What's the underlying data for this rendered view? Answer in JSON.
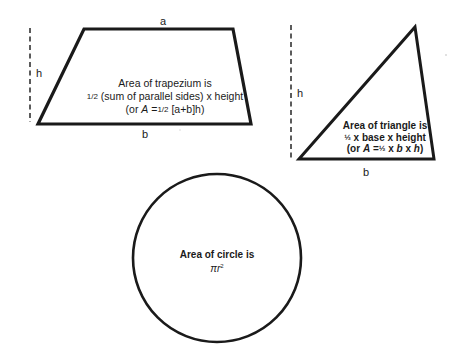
{
  "trapezium": {
    "top_label": "a",
    "bottom_label": "b",
    "height_label": "h",
    "caption": {
      "line1": "Area of trapezium is",
      "line2_frac": "1/2",
      "line2_rest": " (sum of parallel sides) x height",
      "line3_pre": "(or ",
      "line3_var": "A",
      "line3_eq": " =",
      "line3_frac": "1/2",
      "line3_rest": " [a+b]h)"
    },
    "vertices": [
      [
        84,
        29
      ],
      [
        233,
        29
      ],
      [
        251,
        124
      ],
      [
        38,
        124
      ]
    ],
    "stroke_color": "#1a1a1a"
  },
  "triangle": {
    "bottom_label": "b",
    "height_label": "h",
    "caption": {
      "line1": "Area of triangle is",
      "line2_frac": "½",
      "line2_rest": " x base x height",
      "line3_pre": "(or ",
      "line3_var": "A",
      "line3_eq": " =",
      "line3_frac": "½",
      "line3_rest_b": "b",
      "line3_x": " x ",
      "line3_rest_h": "h",
      "line3_close": ")"
    },
    "vertices": [
      [
        415,
        27
      ],
      [
        434,
        159
      ],
      [
        299,
        159
      ]
    ],
    "stroke_color": "#1a1a1a"
  },
  "circle": {
    "caption": {
      "line1": "Area of circle is",
      "line2_pi": "π",
      "line2_r": "r",
      "line2_exp": "2"
    },
    "center": [
      217,
      258
    ],
    "radius": 84,
    "stroke_color": "#1a1a1a"
  }
}
